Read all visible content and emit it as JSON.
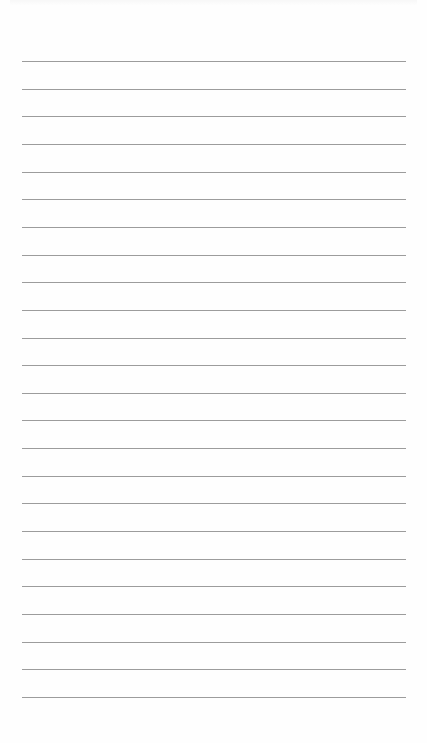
{
  "document": {
    "type": "lined-paper",
    "line_count": 24,
    "line_color": "#9c9c9c",
    "background_color": "#fefefe",
    "text_content": []
  }
}
